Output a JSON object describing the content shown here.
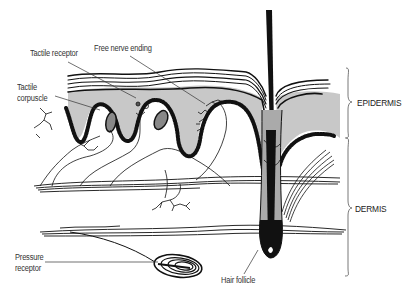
{
  "labels": {
    "tactile_receptor": "Tactile receptor",
    "free_nerve_ending": "Free nerve ending",
    "tactile_corpuscle_line1": "Tactile",
    "tactile_corpuscle_line2": "corpuscle",
    "pressure_receptor_line1": "Pressure",
    "pressure_receptor_line2": "receptor",
    "hair_follicle": "Hair follicle",
    "epidermis": "EPIDERMIS",
    "dermis": "DERMIS"
  },
  "colors": {
    "epidermis_fill": "#c8c8c8",
    "ink": "#111111",
    "label": "#333333",
    "background": "#ffffff"
  }
}
